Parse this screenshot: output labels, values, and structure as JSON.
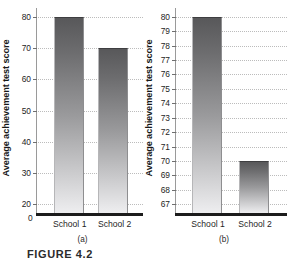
{
  "figure": {
    "label": "FIGURE 4.2"
  },
  "chart_data": [
    {
      "type": "bar",
      "panel": "(a)",
      "title": "",
      "xlabel": "",
      "ylabel": "Average achievement test score",
      "categories": [
        "School 1",
        "School 2"
      ],
      "values": [
        80,
        70
      ],
      "ylim": [
        17,
        83
      ],
      "yticks": [
        20,
        30,
        40,
        50,
        60,
        70,
        80
      ],
      "yticklabels": [
        "20",
        "30",
        "40",
        "50",
        "60",
        "70",
        "80"
      ],
      "axis_break_label": "0",
      "grid": true,
      "legend": "none",
      "bar_color": "#6d6d6f"
    },
    {
      "type": "bar",
      "panel": "(b)",
      "title": "",
      "xlabel": "",
      "ylabel": "Average achievement test score",
      "categories": [
        "School 1",
        "School 2"
      ],
      "values": [
        80,
        70
      ],
      "ylim": [
        66.4,
        80.6
      ],
      "yticks": [
        67,
        68,
        69,
        70,
        71,
        72,
        73,
        74,
        75,
        76,
        77,
        78,
        79,
        80
      ],
      "yticklabels": [
        "67",
        "68",
        "69",
        "70",
        "71",
        "72",
        "73",
        "74",
        "75",
        "76",
        "77",
        "78",
        "79",
        "80"
      ],
      "grid": true,
      "legend": "none",
      "bar_color": "#6d6d6f"
    }
  ]
}
